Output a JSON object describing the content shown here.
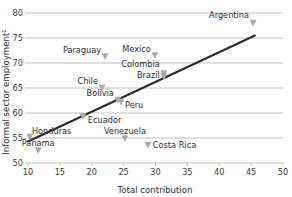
{
  "chart_data": {
    "type": "scatter",
    "title": "",
    "xlabel": "Total contribution",
    "ylabel": "Informal sector employment¹",
    "xlim": [
      10,
      50
    ],
    "ylim": [
      50,
      80
    ],
    "xticks": [
      10,
      15,
      20,
      25,
      30,
      35,
      40,
      45,
      50
    ],
    "xtick_labels": [
      "10",
      "15",
      "20",
      "25",
      "30",
      "35",
      "40",
      "45",
      "50"
    ],
    "yticks": [
      50,
      55,
      60,
      65,
      70,
      75,
      80
    ],
    "ytick_labels": [
      "50",
      "55",
      "60",
      "65",
      "70",
      "75",
      "80"
    ],
    "grid": "horizontal",
    "legend": "none",
    "marker_shape": "triangle-down",
    "marker_color": "#aaaaaa",
    "trend_color": "#2a2a2a",
    "grid_color": "#b9b9b9",
    "points": [
      {
        "label": "Argentina",
        "x": 45.3,
        "y": 78.0,
        "anchor": "end",
        "dx": -4,
        "dy": -5
      },
      {
        "label": "Paraguay",
        "x": 22.1,
        "y": 71.3,
        "anchor": "end",
        "dx": -4,
        "dy": -4
      },
      {
        "label": "Mexico",
        "x": 29.9,
        "y": 71.5,
        "anchor": "end",
        "dx": -4,
        "dy": -4
      },
      {
        "label": "Colombia",
        "x": 31.3,
        "y": 67.9,
        "anchor": "end",
        "dx": -4,
        "dy": -7
      },
      {
        "label": "Brazil",
        "x": 31.3,
        "y": 67.3,
        "anchor": "end",
        "dx": -4,
        "dy": 1
      },
      {
        "label": "Chile",
        "x": 21.6,
        "y": 65.0,
        "anchor": "end",
        "dx": -4,
        "dy": -4
      },
      {
        "label": "Bolivia",
        "x": 24.1,
        "y": 62.6,
        "anchor": "end",
        "dx": -4,
        "dy": -4
      },
      {
        "label": "Peru",
        "x": 24.6,
        "y": 62.2,
        "anchor": "start",
        "dx": 4,
        "dy": 6
      },
      {
        "label": "Ecuador",
        "x": 18.6,
        "y": 59.3,
        "anchor": "start",
        "dx": 5,
        "dy": 6
      },
      {
        "label": "Honduras",
        "x": 10.3,
        "y": 55.2,
        "anchor": "start",
        "dx": 2,
        "dy": -3
      },
      {
        "label": "Venezuela",
        "x": 25.2,
        "y": 54.9,
        "anchor": "middle",
        "dx": 0,
        "dy": -5
      },
      {
        "label": "Panama",
        "x": 11.6,
        "y": 52.5,
        "anchor": "middle",
        "dx": 0,
        "dy": -5
      },
      {
        "label": "Costa Rica",
        "x": 28.8,
        "y": 53.6,
        "anchor": "start",
        "dx": 5,
        "dy": 3
      }
    ],
    "trend": {
      "x0": 10.0,
      "y0": 54.3,
      "x1": 45.6,
      "y1": 75.5
    }
  }
}
